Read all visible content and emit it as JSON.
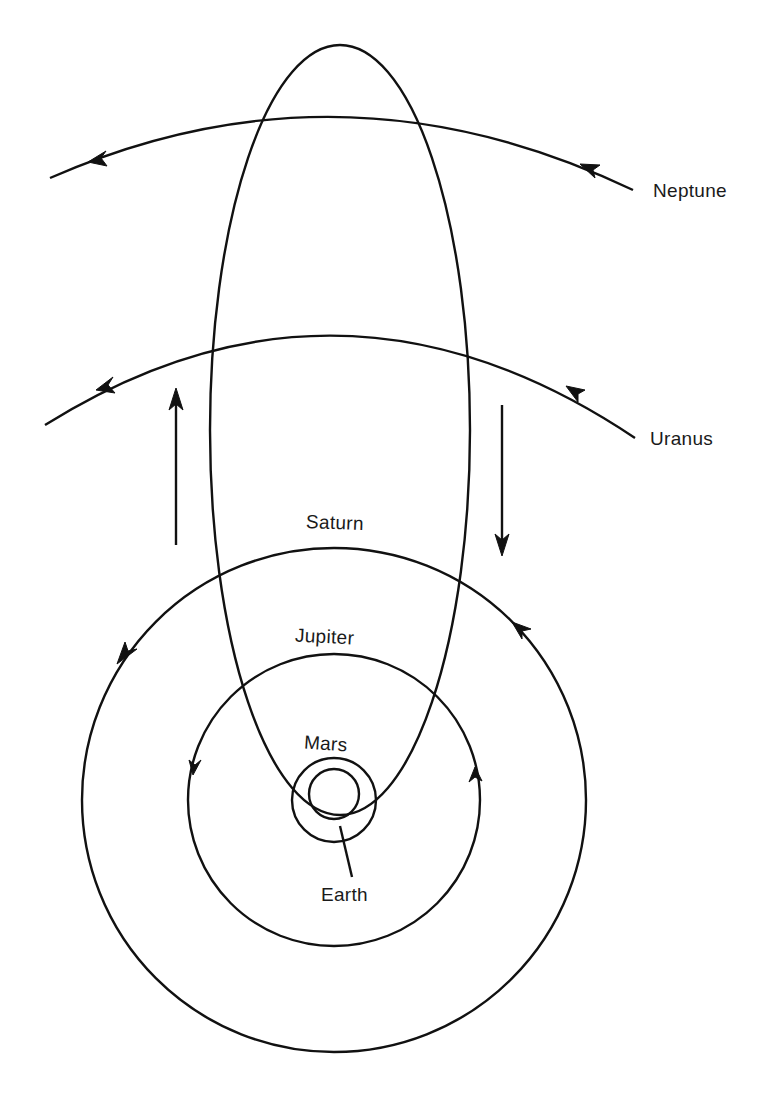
{
  "figure": {
    "type": "orbit-diagram",
    "ink_color": "#111111",
    "background_color": "#ffffff",
    "labels": {
      "neptune": "Neptune",
      "uranus": "Uranus",
      "saturn": "Saturn",
      "jupiter": "Jupiter",
      "mars": "Mars",
      "earth": "Earth"
    },
    "orbits": [
      {
        "name": "Neptune",
        "shape": "arc",
        "direction": "right-to-left"
      },
      {
        "name": "Uranus",
        "shape": "arc",
        "direction": "right-to-left"
      },
      {
        "name": "Saturn",
        "shape": "circle",
        "direction": "counterclockwise"
      },
      {
        "name": "Jupiter",
        "shape": "circle",
        "direction": "counterclockwise"
      },
      {
        "name": "Mars",
        "shape": "circle"
      },
      {
        "name": "Earth",
        "shape": "circle"
      },
      {
        "name": "Comet",
        "shape": "elongated-ellipse"
      }
    ],
    "motion_arrows": [
      {
        "side": "left",
        "direction": "up"
      },
      {
        "side": "right",
        "direction": "down"
      }
    ]
  }
}
